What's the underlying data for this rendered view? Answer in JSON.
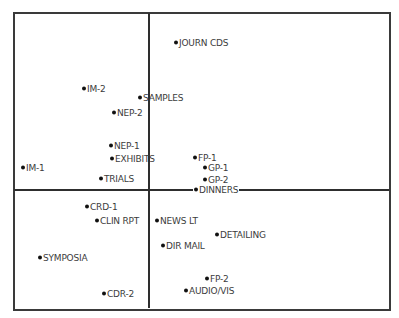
{
  "chart_data": {
    "type": "scatter",
    "title": "",
    "xlabel": "",
    "ylabel": "",
    "grid": false,
    "legend": null,
    "axes": {
      "style": "quadrant cross",
      "x_axis_pixel_y": 190,
      "y_axis_pixel_x": 149
    },
    "frame_px": {
      "left": 13,
      "top": 12,
      "right": 389,
      "bottom": 308
    },
    "points": [
      {
        "label": "JOURN CDS",
        "px": 176,
        "py": 43
      },
      {
        "label": "IM-2",
        "px": 84,
        "py": 89
      },
      {
        "label": "SAMPLES",
        "px": 140,
        "py": 98
      },
      {
        "label": "NEP-2",
        "px": 114,
        "py": 113
      },
      {
        "label": "NEP-1",
        "px": 111,
        "py": 146
      },
      {
        "label": "EXHIBITS",
        "px": 112,
        "py": 159
      },
      {
        "label": "FP-1",
        "px": 195,
        "py": 158
      },
      {
        "label": "GP-1",
        "px": 205,
        "py": 168
      },
      {
        "label": "IM-1",
        "px": 23,
        "py": 168
      },
      {
        "label": "TRIALS",
        "px": 101,
        "py": 179
      },
      {
        "label": "GP-2",
        "px": 205,
        "py": 180
      },
      {
        "label": "DINNERS",
        "px": 195,
        "py": 190,
        "on_axis": true
      },
      {
        "label": "CRD-1",
        "px": 87,
        "py": 207
      },
      {
        "label": "CLIN RPT",
        "px": 97,
        "py": 221
      },
      {
        "label": "NEWS LT",
        "px": 157,
        "py": 221
      },
      {
        "label": "DETAILING",
        "px": 217,
        "py": 235
      },
      {
        "label": "DIR MAIL",
        "px": 163,
        "py": 246
      },
      {
        "label": "SYMPOSIA",
        "px": 40,
        "py": 258
      },
      {
        "label": "FP-2",
        "px": 207,
        "py": 279
      },
      {
        "label": "AUDIO/VIS",
        "px": 186,
        "py": 291
      },
      {
        "label": "CDR-2",
        "px": 104,
        "py": 294
      }
    ],
    "colors": {
      "frame": "#3a3a3a",
      "axis": "#2e2e2e",
      "dot": "#111111",
      "text": "#3c3c3c"
    }
  }
}
